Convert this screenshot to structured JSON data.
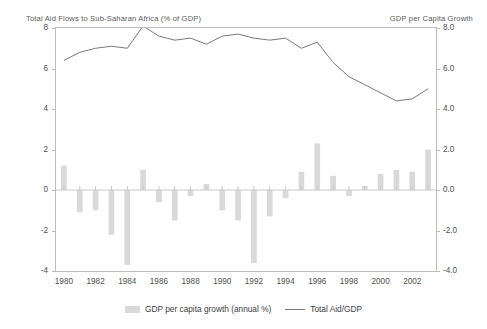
{
  "titles": {
    "left": "Total Aid Flows to Sub-Saharan Africa (% of GDP)",
    "right": "GDP per Capita Growth"
  },
  "legend": {
    "bar_label": "GDP per capita growth (annual %)",
    "line_label": "Total Aid/GDP"
  },
  "colors": {
    "bar": "#d9d9d9",
    "line": "#7a7a7a",
    "frame": "#bdbdbd",
    "text": "#4f4f4f",
    "zero_line": "#c9c9c9"
  },
  "axes": {
    "left_ticks": [
      "8",
      "6",
      "4",
      "2",
      "0",
      "-2",
      "-4"
    ],
    "right_ticks": [
      "8.0",
      "6.0",
      "4.0",
      "2.0",
      "0.0",
      "-2.0",
      "-4.0"
    ],
    "x_ticks": [
      "1980",
      "1982",
      "1984",
      "1986",
      "1988",
      "1990",
      "1992",
      "1994",
      "1996",
      "1998",
      "2000",
      "2002"
    ],
    "ylim": [
      -4,
      8
    ],
    "xlim": [
      1979.5,
      2003.5
    ]
  },
  "chart_data": {
    "type": "bar",
    "title": "Total Aid Flows to Sub-Saharan Africa (% of GDP)",
    "subtitle": "GDP per Capita Growth",
    "xlabel": "",
    "ylabel": "",
    "ylim": [
      -4,
      8
    ],
    "grid": false,
    "legend_position": "bottom",
    "categories": [
      1980,
      1981,
      1982,
      1983,
      1984,
      1985,
      1986,
      1987,
      1988,
      1989,
      1990,
      1991,
      1992,
      1993,
      1994,
      1995,
      1996,
      1997,
      1998,
      1999,
      2000,
      2001,
      2002,
      2003
    ],
    "series": [
      {
        "name": "GDP per capita growth (annual %)",
        "type": "bar",
        "axis": "right",
        "values": [
          1.2,
          -1.1,
          -1.0,
          -2.2,
          -3.7,
          1.0,
          -0.6,
          -1.5,
          -0.3,
          0.3,
          -1.0,
          -1.5,
          -3.6,
          -1.3,
          -0.4,
          0.9,
          2.3,
          0.7,
          -0.3,
          0.2,
          0.8,
          1.0,
          0.9,
          2.0
        ]
      },
      {
        "name": "Total Aid/GDP",
        "type": "line",
        "axis": "left",
        "values": [
          6.4,
          6.8,
          7.0,
          7.1,
          7.0,
          8.1,
          7.6,
          7.4,
          7.5,
          7.2,
          7.6,
          7.7,
          7.5,
          7.4,
          7.5,
          7.0,
          7.3,
          6.3,
          5.6,
          5.2,
          4.8,
          4.4,
          4.5,
          5.0
        ]
      }
    ]
  }
}
